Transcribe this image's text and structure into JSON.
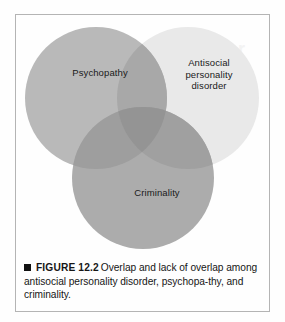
{
  "figure": {
    "diagram_type": "venn",
    "circles": [
      {
        "id": "psychopathy",
        "label": "Psychopathy",
        "fill": "#b9b9b9",
        "cx": 80,
        "cy": 83,
        "r": 71
      },
      {
        "id": "antisocial-personality-disorder",
        "label": "Antisocial\npersonality\ndisorder",
        "fill": "#e9e9e9",
        "cx": 172,
        "cy": 83,
        "r": 71
      },
      {
        "id": "criminality",
        "label": "Criminality",
        "fill": "#acacac",
        "cx": 127,
        "cy": 163,
        "r": 71
      }
    ],
    "overlap_colors": {
      "psychopathy_aspd": "#a8a8a8",
      "psychopathy_criminality": "#9e9e9e",
      "aspd_criminality": "#a0a0a0",
      "triple": "#949494"
    },
    "background": "#fefefe",
    "frame_color": "#b4b4b4",
    "scan_ghost_text": "disorder"
  },
  "caption": {
    "bullet": "square-bullet",
    "figure_number": "FIGURE 12.2",
    "text": "Overlap and lack of overlap among antisocial personality disorder, psychopa-thy, and criminality."
  }
}
